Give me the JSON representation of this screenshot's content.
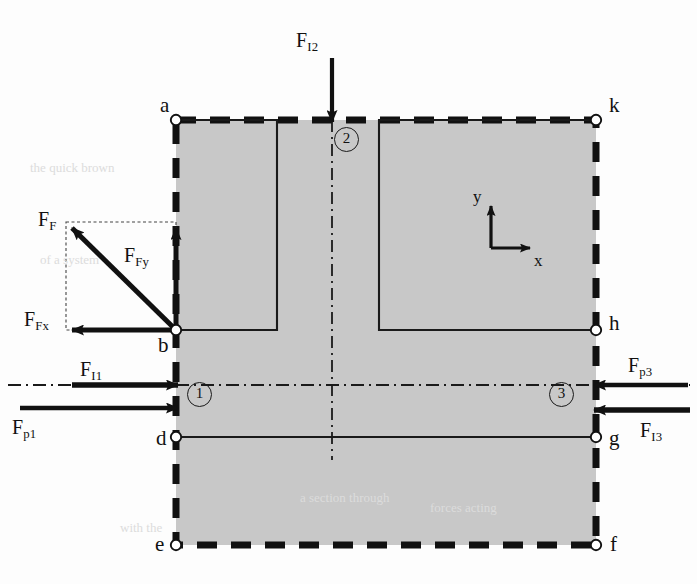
{
  "figure": {
    "type": "free-body-diagram",
    "background_color": "#fdfdfd",
    "fill_color": "#c8c8c8",
    "line_color": "#111111"
  },
  "nodes": [
    {
      "id": "a",
      "label": "a",
      "x": 176,
      "y": 120,
      "label_x": 160,
      "label_y": 95
    },
    {
      "id": "k",
      "label": "k",
      "x": 596,
      "y": 120,
      "label_x": 609,
      "label_y": 95
    },
    {
      "id": "b",
      "label": "b",
      "x": 176,
      "y": 330,
      "label_x": 158,
      "label_y": 335
    },
    {
      "id": "h",
      "label": "h",
      "x": 596,
      "y": 330,
      "label_x": 609,
      "label_y": 313
    },
    {
      "id": "d",
      "label": "d",
      "x": 176,
      "y": 437,
      "label_x": 156,
      "label_y": 428
    },
    {
      "id": "g",
      "label": "g",
      "x": 596,
      "y": 437,
      "label_x": 609,
      "label_y": 428
    },
    {
      "id": "e",
      "label": "e",
      "x": 176,
      "y": 545,
      "label_x": 155,
      "label_y": 534
    },
    {
      "id": "f",
      "label": "f",
      "x": 596,
      "y": 545,
      "label_x": 610,
      "label_y": 534
    }
  ],
  "section_markers": [
    {
      "id": "1",
      "label": "1",
      "x": 187,
      "y": 393
    },
    {
      "id": "2",
      "label": "2",
      "x": 334,
      "y": 127
    },
    {
      "id": "3",
      "label": "3",
      "x": 563,
      "y": 393
    }
  ],
  "forces": [
    {
      "id": "F_I2",
      "base": "F",
      "sub": "I2",
      "direction": "down",
      "label_x": 296,
      "label_y": 30
    },
    {
      "id": "F_F",
      "base": "F",
      "sub": "F",
      "direction": "up-left-diagonal",
      "label_x": 38,
      "label_y": 209
    },
    {
      "id": "F_Fy",
      "base": "F",
      "sub": "Fy",
      "direction": "up",
      "label_x": 124,
      "label_y": 245
    },
    {
      "id": "F_Fx",
      "base": "F",
      "sub": "Fx",
      "direction": "left",
      "label_x": 24,
      "label_y": 309
    },
    {
      "id": "F_I1",
      "base": "F",
      "sub": "I1",
      "direction": "right",
      "label_x": 80,
      "label_y": 359
    },
    {
      "id": "F_p1",
      "base": "F",
      "sub": "p1",
      "direction": "right",
      "label_x": 12,
      "label_y": 417
    },
    {
      "id": "F_p3",
      "base": "F",
      "sub": "p3",
      "direction": "left",
      "label_x": 628,
      "label_y": 355
    },
    {
      "id": "F_I3",
      "base": "F",
      "sub": "I3",
      "direction": "left",
      "label_x": 640,
      "label_y": 420
    }
  ],
  "axes": {
    "origin_x": 491,
    "origin_y": 248,
    "y_label": "y",
    "y_label_x": 473,
    "y_label_y": 188,
    "x_label": "x",
    "x_label_x": 534,
    "x_label_y": 252
  },
  "ghost_text": [
    {
      "text": "the quick brown",
      "x": 30,
      "y": 160
    },
    {
      "text": "of a system",
      "x": 40,
      "y": 252
    },
    {
      "text": "a section through",
      "x": 300,
      "y": 490
    },
    {
      "text": "forces acting",
      "x": 430,
      "y": 500
    },
    {
      "text": "with the",
      "x": 120,
      "y": 520
    }
  ]
}
